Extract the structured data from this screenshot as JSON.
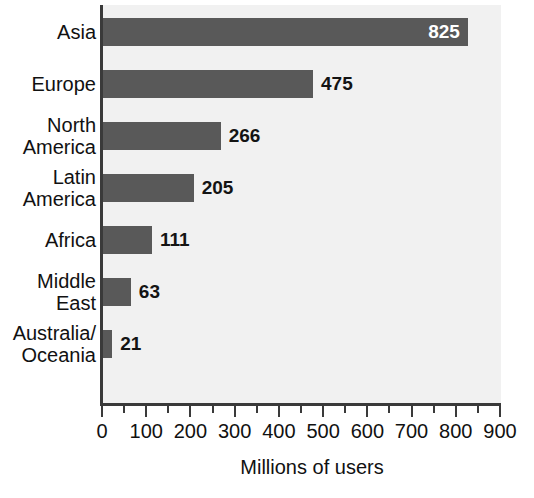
{
  "chart_data": {
    "type": "bar",
    "orientation": "horizontal",
    "title": "",
    "subtitle": "",
    "xlabel": "Millions of users",
    "ylabel": "",
    "categories": [
      "Asia",
      "Europe",
      "North America",
      "Latin America",
      "Africa",
      "Middle East",
      "Australia/ Oceania"
    ],
    "category_lines": [
      [
        "Asia"
      ],
      [
        "Europe"
      ],
      [
        "North",
        "America"
      ],
      [
        "Latin",
        "America"
      ],
      [
        "Africa"
      ],
      [
        "Middle",
        "East"
      ],
      [
        "Australia/",
        "Oceania"
      ]
    ],
    "values": [
      825,
      475,
      266,
      205,
      111,
      63,
      21
    ],
    "value_labels": [
      "825",
      "475",
      "266",
      "205",
      "111",
      "63",
      "21"
    ],
    "value_label_placement": [
      "inside",
      "outside",
      "outside",
      "outside",
      "outside",
      "outside",
      "outside"
    ],
    "xlim": [
      0,
      900
    ],
    "xticks": [
      0,
      100,
      200,
      300,
      400,
      500,
      600,
      700,
      800,
      900
    ],
    "xtick_labels": [
      "0",
      "100",
      "200",
      "300",
      "400",
      "500",
      "600",
      "700",
      "800",
      "900"
    ],
    "minor_tick_step": 50,
    "grid": false,
    "legend": false,
    "colors": {
      "bar_fill": "#595959",
      "plot_background": "#f1f1f1",
      "axis_line": "#3a3a3a",
      "label_text": "#111111",
      "inside_value_text": "#ffffff",
      "outside_value_text": "#141414",
      "page_background": "#ffffff"
    }
  }
}
